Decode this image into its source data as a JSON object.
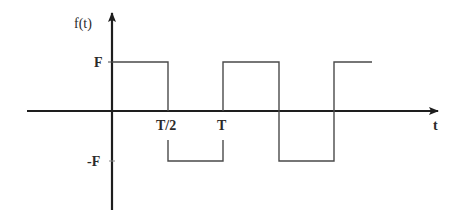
{
  "diagram": {
    "type": "square-wave",
    "colors": {
      "axis": "#1e1e1e",
      "wave": "#4a4a4a",
      "text": "#2a2a2a"
    },
    "labels": {
      "y_axis": "f(t)",
      "x_axis": "t",
      "amplitude_pos": "F",
      "amplitude_neg": "-F",
      "half_period": "T/2",
      "period": "T"
    },
    "geometry": {
      "origin": [
        112,
        111
      ],
      "x_axis": {
        "x1": 27,
        "x2": 438,
        "y": 111
      },
      "y_axis": {
        "x": 112,
        "y1": 12,
        "y2": 210
      },
      "level_pos_y": 62,
      "level_neg_y": 161,
      "transitions_x": [
        168,
        223,
        279,
        334
      ],
      "wave_end_x": 372
    }
  }
}
